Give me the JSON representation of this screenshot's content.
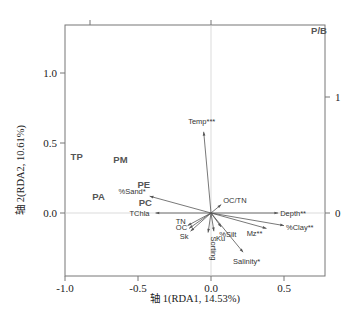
{
  "chart_data": {
    "type": "scatter",
    "subtype": "RDA biplot",
    "title": "",
    "xlabel": "轴 1(RDA1, 14.53%)",
    "ylabel": "轴 2(RDA2, 10.61%)",
    "xlim": [
      -1.0,
      0.75
    ],
    "ylim": [
      -0.45,
      1.35
    ],
    "x_ticks": [
      "-1.0",
      "-0.5",
      "0.0",
      "0.5"
    ],
    "y_ticks": [
      "0.0",
      "0.5",
      "1.0"
    ],
    "right_axis_ticks": [
      "0",
      "1"
    ],
    "grid": false,
    "zero_lines": true,
    "site_scores": [
      {
        "label": "P/B",
        "x": 0.74,
        "y": 1.28
      },
      {
        "label": "TP",
        "x": -0.92,
        "y": 0.38
      },
      {
        "label": "PM",
        "x": -0.62,
        "y": 0.36
      },
      {
        "label": "PE",
        "x": -0.46,
        "y": 0.18
      },
      {
        "label": "PA",
        "x": -0.77,
        "y": 0.09
      },
      {
        "label": "PC",
        "x": -0.45,
        "y": 0.05
      }
    ],
    "env_vectors": [
      {
        "label": "Temp***",
        "x": -0.05,
        "y": 0.58
      },
      {
        "label": "%Sand*",
        "x": -0.42,
        "y": 0.12
      },
      {
        "label": "TChla",
        "x": -0.38,
        "y": 0.0
      },
      {
        "label": "TN",
        "x": -0.16,
        "y": -0.09
      },
      {
        "label": "OC",
        "x": -0.15,
        "y": -0.11
      },
      {
        "label": "Sk",
        "x": -0.14,
        "y": -0.13
      },
      {
        "label": "Sorting",
        "x": -0.02,
        "y": -0.14
      },
      {
        "label": "Ku",
        "x": 0.02,
        "y": -0.13
      },
      {
        "label": "%Silt",
        "x": 0.07,
        "y": -0.1
      },
      {
        "label": "OC/TN",
        "x": 0.07,
        "y": 0.06
      },
      {
        "label": "Depth**",
        "x": 0.46,
        "y": 0.0
      },
      {
        "label": "%Clay**",
        "x": 0.5,
        "y": -0.09
      },
      {
        "label": "Mz**",
        "x": 0.38,
        "y": -0.11
      },
      {
        "label": "Salinity*",
        "x": 0.22,
        "y": -0.28
      }
    ]
  },
  "caption_partial": "（图注文字被截断）"
}
